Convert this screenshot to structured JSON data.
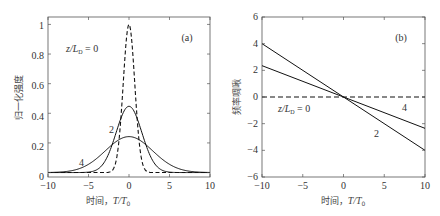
{
  "chart_data": [
    {
      "type": "line",
      "panel_label": "(a)",
      "title": "",
      "xlabel": "时间，T/T0",
      "ylabel": "归一化强度",
      "xlim": [
        -10,
        10
      ],
      "ylim": [
        0,
        1.05
      ],
      "xticks": [
        -10,
        -5,
        0,
        5,
        10
      ],
      "yticks": [
        0,
        0.2,
        0.4,
        0.6,
        0.8,
        1
      ],
      "ytick_labels": [
        "0",
        "0.2",
        "0.4",
        "0.6",
        "0.8",
        "1"
      ],
      "grid": false,
      "series": [
        {
          "name": "z/LD = 0",
          "style": "dashed",
          "z": 0,
          "peak": 1.0,
          "x": [
            -3,
            -2,
            -1.5,
            -1,
            -0.5,
            0,
            0.5,
            1,
            1.5,
            2,
            3
          ],
          "values": [
            0.0001,
            0.018,
            0.105,
            0.368,
            0.779,
            1.0,
            0.779,
            0.368,
            0.105,
            0.018,
            0.0001
          ]
        },
        {
          "name": "2",
          "style": "solid",
          "z": 2,
          "peak": 0.447,
          "x": [
            -8,
            -6,
            -4,
            -3,
            -2,
            -1,
            0,
            1,
            2,
            3,
            4,
            6,
            8
          ],
          "values": [
            0.0001,
            0.003,
            0.018,
            0.074,
            0.2,
            0.366,
            0.447,
            0.366,
            0.2,
            0.074,
            0.018,
            0.003,
            0.0001
          ]
        },
        {
          "name": "4",
          "style": "solid",
          "z": 4,
          "peak": 0.243,
          "x": [
            -10,
            -8,
            -6,
            -4,
            -2,
            0,
            2,
            4,
            6,
            8,
            10
          ],
          "values": [
            0.0007,
            0.006,
            0.029,
            0.094,
            0.192,
            0.243,
            0.192,
            0.094,
            0.029,
            0.006,
            0.0007
          ]
        }
      ],
      "annotations": [
        {
          "text": "z/LD = 0",
          "x": -6.2,
          "y": 0.88
        },
        {
          "text": "2",
          "x": -2.3,
          "y": 0.33
        },
        {
          "text": "4",
          "x": -5.7,
          "y": 0.1
        },
        {
          "text": "(a)",
          "x": 6.7,
          "y": 0.94
        }
      ]
    },
    {
      "type": "line",
      "panel_label": "(b)",
      "title": "",
      "xlabel": "时间，T/T0",
      "ylabel": "频率啁啾",
      "xlim": [
        -10,
        10
      ],
      "ylim": [
        -6,
        6
      ],
      "xticks": [
        -10,
        -5,
        0,
        5,
        10
      ],
      "yticks": [
        -6,
        -4,
        -2,
        0,
        2,
        4,
        6
      ],
      "ytick_labels": [
        "−6",
        "−4",
        "−2",
        "0",
        "2",
        "4",
        "6"
      ],
      "grid": false,
      "series": [
        {
          "name": "z/LD = 0",
          "style": "dashed",
          "x": [
            -10,
            10
          ],
          "values": [
            0,
            0
          ]
        },
        {
          "name": "2",
          "style": "solid",
          "x": [
            -10,
            10
          ],
          "values": [
            4.0,
            -4.0
          ]
        },
        {
          "name": "4",
          "style": "solid",
          "x": [
            -10,
            10
          ],
          "values": [
            2.35,
            -2.35
          ]
        }
      ],
      "annotations": [
        {
          "text": "z/LD = 0",
          "x": -7.5,
          "y": -0.8
        },
        {
          "text": "4",
          "x": 7.5,
          "y": -0.6
        },
        {
          "text": "2",
          "x": 4.2,
          "y": -2.5
        },
        {
          "text": "(b)",
          "x": 6.7,
          "y": 4.3
        }
      ]
    }
  ],
  "labels": {
    "a": {
      "panel": "(a)",
      "xlabel_prefix": "时间，",
      "xlabel_var": "T/T",
      "xlabel_sub": "0",
      "ylabel": "归一化强度",
      "ann_z_prefix": "z/L",
      "ann_z_sub": "D",
      "ann_z_suffix": " = 0",
      "ann_2": "2",
      "ann_4": "4",
      "xticks": [
        "−10",
        "−5",
        "0",
        "5",
        "10"
      ],
      "yticks": [
        "0",
        "0.2",
        "0.4",
        "0.6",
        "0.8",
        "1"
      ]
    },
    "b": {
      "panel": "(b)",
      "xlabel_prefix": "时间，",
      "xlabel_var": "T/T",
      "xlabel_sub": "0",
      "ylabel": "频率啁啾",
      "ann_z_prefix": "z/L",
      "ann_z_sub": "D",
      "ann_z_suffix": " = 0",
      "ann_2": "2",
      "ann_4": "4",
      "xticks": [
        "−10",
        "−5",
        "0",
        "5",
        "10"
      ],
      "yticks": [
        "6",
        "4",
        "2",
        "0",
        "−2",
        "−4",
        "−6"
      ]
    }
  }
}
